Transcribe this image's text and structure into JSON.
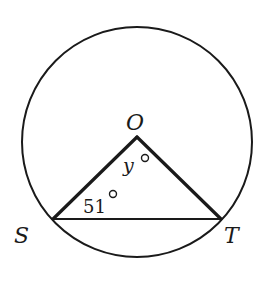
{
  "diagram": {
    "type": "circle-with-inscribed-triangle",
    "stroke_color": "#1a1a1a",
    "background": "#ffffff",
    "circle": {
      "center": "O",
      "cx": 137,
      "cy": 142,
      "r": 115
    },
    "points": {
      "O": {
        "label": "O",
        "x": 137,
        "y": 137
      },
      "S": {
        "label": "S",
        "x": 53,
        "y": 219
      },
      "T": {
        "label": "T",
        "x": 221,
        "y": 219
      }
    },
    "angles": {
      "at_S": {
        "value": "51",
        "unit": "°"
      },
      "at_O": {
        "value": "y",
        "unit": "°"
      }
    },
    "segments": [
      "OS",
      "OT",
      "ST"
    ]
  }
}
